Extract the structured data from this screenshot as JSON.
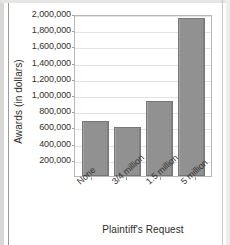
{
  "chart_data": {
    "type": "bar",
    "title": "",
    "subtitle": "",
    "xlabel": "Plaintiff's Request",
    "ylabel": "Awards (in dollars)",
    "categories": [
      "None",
      "3/4 million",
      "1.5 million",
      "5 million"
    ],
    "values": [
      680000,
      600000,
      920000,
      1950000
    ],
    "series": [
      {
        "name": "Awards",
        "values": [
          680000,
          600000,
          920000,
          1950000
        ]
      }
    ],
    "ylim": [
      0,
      2000000
    ],
    "y_tick_labels": [
      "2,000,000",
      "1,800,000",
      "1,600,000",
      "1,400,000",
      "1,200,000",
      "1,000,000",
      "800,000",
      "600,000",
      "400,000",
      "200,000"
    ],
    "y_tick_values": [
      2000000,
      1800000,
      1600000,
      1400000,
      1200000,
      1000000,
      800000,
      600000,
      400000,
      200000
    ],
    "y_tick_step": 200000,
    "grid": true,
    "grid_axis": "y",
    "legend": false,
    "legend_position": "none",
    "bar_color": "#919191",
    "bar_border_color": "#767676",
    "plot_border_color": "#b9b9b7",
    "gridline_color": "#e2e2e0",
    "text_color": "#33312f",
    "background_color": "#ffffff",
    "x_tick_label_rotation": -42
  }
}
